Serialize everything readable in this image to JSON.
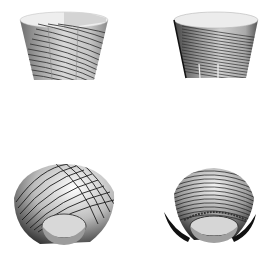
{
  "figure": {
    "background": "#ffffff",
    "panels": [
      {
        "id": "top-left",
        "shape": "faceted-cup",
        "stripes": 14,
        "x": 18,
        "y": 10,
        "w": 92,
        "h": 74
      },
      {
        "id": "top-right",
        "shape": "faceted-cup-dense",
        "stripes": 24,
        "x": 172,
        "y": 10,
        "w": 88,
        "h": 72
      },
      {
        "id": "bottom-left",
        "shape": "spiral-bowl",
        "stripes": 16,
        "x": 10,
        "y": 152,
        "w": 108,
        "h": 96
      },
      {
        "id": "bottom-right",
        "shape": "spiral-bowl-dense",
        "stripes": 28,
        "x": 160,
        "y": 158,
        "w": 100,
        "h": 90
      }
    ]
  }
}
